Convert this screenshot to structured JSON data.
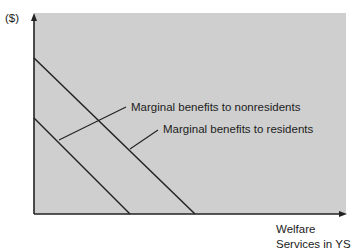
{
  "diagram": {
    "y_axis_label": "($)",
    "x_axis_label_line1": "Welfare",
    "x_axis_label_line2": "Services in YS",
    "curves": [
      {
        "name": "Marginal benefits to nonresidents",
        "label": "Marginal benefits to nonresidents"
      },
      {
        "name": "Marginal benefits to residents",
        "label": "Marginal benefits to residents"
      }
    ],
    "colors": {
      "panel": "#cfcfcf",
      "line": "#222222",
      "background": "#ffffff"
    }
  }
}
